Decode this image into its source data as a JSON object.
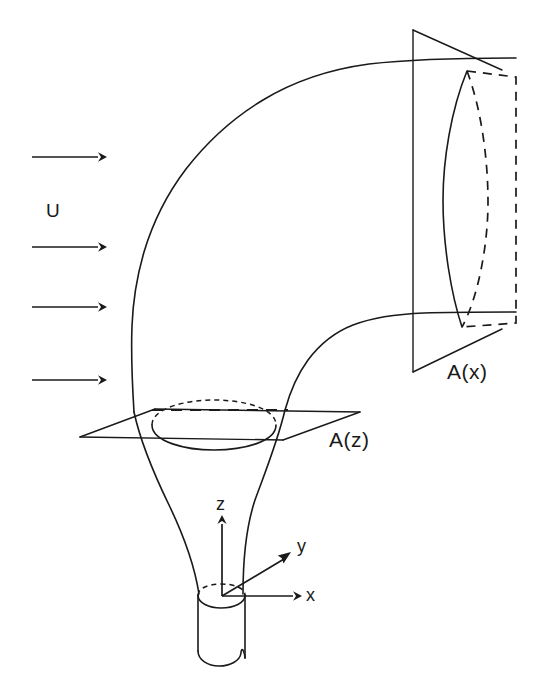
{
  "figure": {
    "kind": "line-diagram",
    "background_color": "#ffffff",
    "line_color": "#1a1a1a",
    "width": 546,
    "height": 689
  },
  "labels": {
    "crossflow_velocity": "U",
    "plane_ax": "A(x)",
    "plane_az": "A(z)",
    "axis_z": "z",
    "axis_y": "y",
    "axis_x": "x"
  },
  "crossflow": {
    "label": "U",
    "arrow_count": 4,
    "direction": "left-to-right",
    "arrows": [
      {
        "x1": 32,
        "y1": 157,
        "x2": 105,
        "y2": 157
      },
      {
        "x1": 32,
        "y1": 247,
        "x2": 105,
        "y2": 247
      },
      {
        "x1": 32,
        "y1": 307,
        "x2": 105,
        "y2": 307
      },
      {
        "x1": 32,
        "y1": 380,
        "x2": 105,
        "y2": 380
      }
    ]
  },
  "axes": {
    "origin": {
      "x": 222,
      "y": 596
    },
    "z": {
      "label": "z",
      "tip_x": 222,
      "tip_y": 517
    },
    "y": {
      "label": "y",
      "tip_x": 289,
      "tip_y": 554
    },
    "x": {
      "label": "x",
      "tip_x": 300,
      "tip_y": 596
    }
  },
  "plane_ax": {
    "label": "A(x)",
    "orientation": "vertical",
    "corners": [
      {
        "x": 413,
        "y": 30
      },
      {
        "x": 501,
        "y": 70
      },
      {
        "x": 501,
        "y": 329
      },
      {
        "x": 413,
        "y": 372
      }
    ],
    "cross_section": {
      "top_point": {
        "x": 467,
        "y": 71
      },
      "bottom_point": {
        "x": 462,
        "y": 327
      },
      "solid_edge": "left-bulging arc",
      "dashed_edge": "right-bulging arc",
      "dashed_box_right_edge_x": 516
    }
  },
  "plane_az": {
    "label": "A(z)",
    "orientation": "horizontal",
    "corners": [
      {
        "x": 80,
        "y": 437
      },
      {
        "x": 155,
        "y": 409
      },
      {
        "x": 360,
        "y": 412
      },
      {
        "x": 283,
        "y": 440
      }
    ],
    "cross_section": {
      "center": {
        "x": 214,
        "y": 425
      },
      "rx": 62,
      "ry": 15,
      "upper_arc": "dashed",
      "lower_arc": "solid",
      "chord_dashed_y": 410
    }
  },
  "stack": {
    "shape": "cylinder",
    "left_x": 198,
    "right_x": 245,
    "top_y": 595,
    "bottom_y": 660,
    "top_rim": "dashed ellipse (hidden back) with solid front arc",
    "bottom_edge": "broken / torn-off"
  }
}
